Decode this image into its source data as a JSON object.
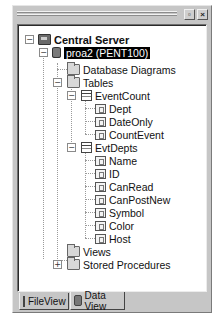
{
  "window": {
    "controls": {
      "restore_label": "▫",
      "close_label": "×"
    }
  },
  "tree": {
    "root": {
      "label": "Central Server",
      "icon": "server-icon",
      "expanded": true
    },
    "database": {
      "label": "proa2 (PENT100)",
      "icon": "database-icon",
      "selected": true,
      "expanded": true
    },
    "folders": {
      "diagrams": {
        "label": "Database Diagrams",
        "icon": "folder-icon"
      },
      "tables": {
        "label": "Tables",
        "icon": "folder-icon",
        "expanded": true
      },
      "views": {
        "label": "Views",
        "icon": "folder-icon"
      },
      "procedures": {
        "label": "Stored Procedures",
        "icon": "folder-icon",
        "expanded": false
      }
    },
    "tables": [
      {
        "label": "EventCount",
        "columns": [
          "Dept",
          "DateOnly",
          "CountEvent"
        ]
      },
      {
        "label": "EvtDepts",
        "columns": [
          "Name",
          "ID",
          "CanRead",
          "CanPostNew",
          "Symbol",
          "Color",
          "Host"
        ]
      }
    ],
    "expand_glyphs": {
      "collapse": "−",
      "expand": "+"
    }
  },
  "tabs": [
    {
      "label": "FileView",
      "icon": "file-icon",
      "active": false
    },
    {
      "label": "Data View",
      "icon": "database-icon",
      "active": true
    }
  ]
}
